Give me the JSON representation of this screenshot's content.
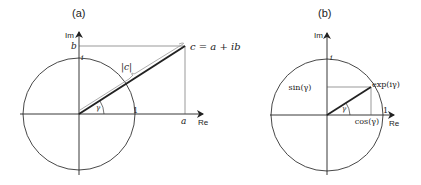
{
  "panel_a": {
    "title": "(a)",
    "axis_re": "Re",
    "axis_im": "Im",
    "label_b": "b",
    "label_a": "a",
    "label_i": "i",
    "label_one": "1",
    "label_modulus": "|c|",
    "label_point": "c = a + ib",
    "label_angle": "γ"
  },
  "panel_b": {
    "title": "(b)",
    "axis_re": "Re",
    "axis_im": "Im",
    "label_i": "i",
    "label_one": "1",
    "label_sin": "sin(γ)",
    "label_cos": "cos(γ)",
    "label_point": "exp(iγ)",
    "label_angle": "γ"
  },
  "colors": {
    "ink": "#222222",
    "guide": "#555555",
    "brace": "#999999"
  }
}
